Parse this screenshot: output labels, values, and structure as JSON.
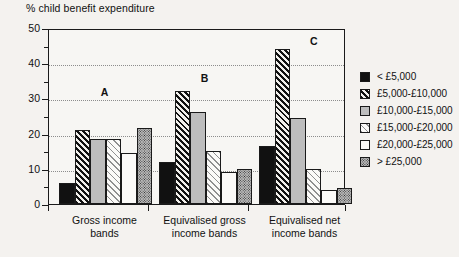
{
  "chart_data": {
    "type": "bar",
    "title": "% child benefit expenditure",
    "xlabel": "",
    "ylabel": "% child benefit expenditure",
    "ylim": [
      0,
      50
    ],
    "yticks": [
      0,
      10,
      20,
      30,
      40,
      50
    ],
    "ytick_labels": [
      "0",
      "10",
      "20",
      "30",
      "40",
      "50"
    ],
    "minor_yticks": [
      5,
      15,
      25,
      35,
      45
    ],
    "grid": "horizontal-dotted",
    "legend_position": "right",
    "categories": [
      "Gross income bands",
      "Equivalised gross income bands",
      "Equivalised net income bands"
    ],
    "group_annotations": [
      "A",
      "B",
      "C"
    ],
    "series": [
      {
        "name": "< £5,000",
        "pattern": "solid-black",
        "values": [
          6,
          12,
          16.5
        ]
      },
      {
        "name": "£5,000-£10,000",
        "pattern": "diagonal-hatch",
        "values": [
          21,
          32,
          44
        ]
      },
      {
        "name": "£10,000-£15,000",
        "pattern": "light-gray",
        "values": [
          18.5,
          26,
          24.5
        ]
      },
      {
        "name": "£15,000-£20,000",
        "pattern": "light-hatch",
        "values": [
          18.5,
          15,
          10
        ]
      },
      {
        "name": "£20,000-£25,000",
        "pattern": "white",
        "values": [
          14.5,
          9,
          4
        ]
      },
      {
        "name": "> £25,000",
        "pattern": "stipple-gray",
        "values": [
          21.5,
          10,
          4.5
        ]
      }
    ]
  },
  "legend": {
    "items": [
      {
        "label": "< £5,000"
      },
      {
        "label": "£5,000-£10,000"
      },
      {
        "label": "£10,000-£15,000"
      },
      {
        "label": "£15,000-£20,000"
      },
      {
        "label": "£20,000-£25,000"
      },
      {
        "label": "> £25,000"
      }
    ]
  },
  "axis": {
    "y_title": "% child benefit expenditure",
    "y_labels": [
      "50",
      "40",
      "30",
      "20",
      "10",
      "0"
    ],
    "x_labels": [
      {
        "line1": "Gross income",
        "line2": "bands"
      },
      {
        "line1": "Equivalised gross",
        "line2": "income bands"
      },
      {
        "line1": "Equivalised net",
        "line2": "income bands"
      }
    ]
  },
  "colors": {
    "background": "#f4f2ef",
    "plot_background": "#f7f6f3",
    "axis": "#1a1a1a",
    "gridline": "#8d8d8d",
    "bar_solid": "#111111",
    "bar_gray": "#bdbdbd",
    "bar_white": "#fbfaf8"
  }
}
